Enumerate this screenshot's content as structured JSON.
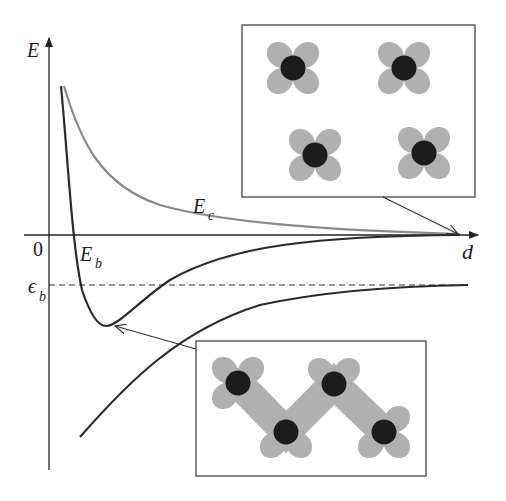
{
  "diagram": {
    "axes": {
      "y_label": "E",
      "x_label": "d",
      "origin_label": "0"
    },
    "curves": [
      {
        "name": "E_c",
        "label_main": "E",
        "label_sub": "c",
        "color": "#8a8a8a",
        "description": "repulsive core energy curve, decays to zero"
      },
      {
        "name": "E_b",
        "label_main": "E",
        "label_sub": "b",
        "color": "#2a2a2a",
        "description": "binding energy curve with minimum, approaches zero"
      },
      {
        "name": "lower",
        "color": "#2a2a2a",
        "description": "lower curve rising toward epsilon_b asymptote"
      }
    ],
    "reference_line": {
      "label_main": "ϵ",
      "label_sub": "b",
      "style": "dashed"
    },
    "insets": [
      {
        "name": "square-lattice-inset",
        "description": "four separated flower-shaped particles in a 2x2 grid",
        "points_to": "large d on axis"
      },
      {
        "name": "chain-inset",
        "description": "four overlapping flower-shaped particles in a zigzag chain",
        "points_to": "minimum of E_b"
      }
    ],
    "colors": {
      "petal": "#b0b0b0",
      "core": "#1c1c1c",
      "frame": "#333333",
      "axis": "#222222"
    }
  }
}
